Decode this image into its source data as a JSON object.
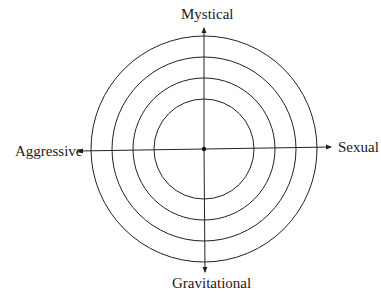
{
  "diagram": {
    "type": "concentric-circles-with-axes",
    "center": {
      "x": 204,
      "y": 149
    },
    "radii": [
      50,
      71,
      92,
      113
    ],
    "line_color": "#222222",
    "axes": {
      "top": "Mystical",
      "bottom": "Gravitational",
      "left": "Aggressive",
      "right": "Sexual"
    }
  }
}
